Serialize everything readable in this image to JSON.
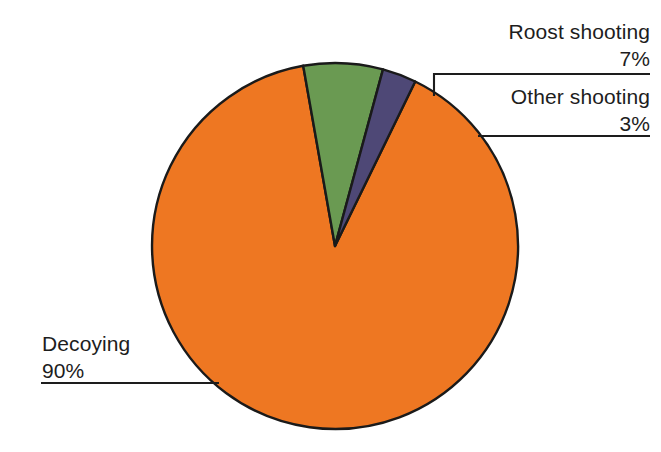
{
  "chart_data": {
    "type": "pie",
    "title": "",
    "subtitle": "",
    "xlabel": "",
    "ylabel": "",
    "legend_position": "callout-labels",
    "grid": false,
    "categories": [
      "Decoying",
      "Roost shooting",
      "Other shooting"
    ],
    "values": [
      90,
      7,
      3
    ],
    "unit": "%",
    "slices": [
      {
        "label": "Decoying",
        "value": 90,
        "value_text": "90%",
        "color": "#EE7722",
        "start_angle_deg": 42,
        "sweep_deg": 324
      },
      {
        "label": "Roost shooting",
        "value": 7,
        "value_text": "7%",
        "color": "#6A9A52",
        "start_angle_deg": -10,
        "sweep_deg": 25.2
      },
      {
        "label": "Other shooting",
        "value": 3,
        "value_text": "3%",
        "color": "#4E4876",
        "start_angle_deg": 15.2,
        "sweep_deg": 10.8
      }
    ],
    "colors": {
      "decoying": "#EE7722",
      "roost_shooting": "#6A9A52",
      "other_shooting": "#4E4876",
      "outline": "#1a1a1a",
      "leader_line": "#1d1d1d",
      "text": "#1d1d1d",
      "background": "#ffffff"
    }
  },
  "callouts": {
    "roost": {
      "label": "Roost shooting",
      "percent": "7%"
    },
    "other": {
      "label": "Other shooting",
      "percent": "3%"
    },
    "decoying": {
      "label": "Decoying",
      "percent": "90%"
    }
  }
}
